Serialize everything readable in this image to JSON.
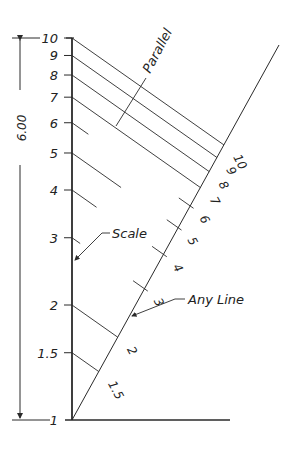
{
  "diagram": {
    "ink_color": "#2a2a2a",
    "dimension": {
      "label": "6.00"
    },
    "scale_label": "Scale",
    "any_line_label": "Any Line",
    "parallel_label": "Parallel",
    "scale_ticks": [
      {
        "value": 1,
        "label": "1"
      },
      {
        "value": 1.5,
        "label": "1.5"
      },
      {
        "value": 2,
        "label": "2"
      },
      {
        "value": 3,
        "label": "3"
      },
      {
        "value": 4,
        "label": "4"
      },
      {
        "value": 5,
        "label": "5"
      },
      {
        "value": 6,
        "label": "6"
      },
      {
        "value": 7,
        "label": "7"
      },
      {
        "value": 8,
        "label": "8"
      },
      {
        "value": 9,
        "label": "9"
      },
      {
        "value": 10,
        "label": "10"
      }
    ],
    "any_line_ticks": [
      {
        "value": 1.5,
        "label": "1.5"
      },
      {
        "value": 2,
        "label": "2"
      },
      {
        "value": 3,
        "label": "3"
      },
      {
        "value": 4,
        "label": "4"
      },
      {
        "value": 5,
        "label": "5"
      },
      {
        "value": 6,
        "label": "6"
      },
      {
        "value": 7,
        "label": "7"
      },
      {
        "value": 8,
        "label": "8"
      },
      {
        "value": 9,
        "label": "9"
      },
      {
        "value": 10,
        "label": "10"
      }
    ]
  }
}
